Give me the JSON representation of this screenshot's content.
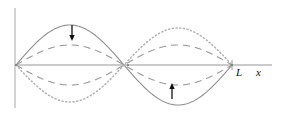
{
  "figure": {
    "background_color": "#ffffff",
    "width": 281,
    "height": 117
  },
  "axes": {
    "x_axis": {
      "name": "horizontal-axis",
      "label": "x",
      "y_position": 65,
      "x_start": 15,
      "x_end": 272,
      "color": "#8a8a8a"
    },
    "y_axis": {
      "name": "vertical-axis",
      "x_position": 15,
      "y_start": 8,
      "y_end": 108,
      "color": "#c9c9c9"
    }
  },
  "markers": [
    {
      "name": "origin-node",
      "label": "",
      "x": 16,
      "y": 65
    },
    {
      "name": "middle-node",
      "label": "",
      "x": 128,
      "y": 65
    },
    {
      "name": "end-node",
      "label": "L",
      "x": 232,
      "y": 65
    }
  ],
  "labels": {
    "length_label": "L",
    "x_axis_label": "x"
  },
  "chart_data": {
    "type": "line",
    "title": "",
    "xlabel": "x",
    "ylabel": "",
    "xlim": [
      0,
      232
    ],
    "ylim": [
      -45,
      45
    ],
    "grid": false,
    "legend": "none",
    "x_tick_labels": [
      "L"
    ],
    "x_tick_values": [
      232
    ],
    "wavelength_mode": 2,
    "string_length_px": 216,
    "baseline_y": 65,
    "series": [
      {
        "name": "solid-curve-max-displacement",
        "style": "solid",
        "color": "#8f8f8f",
        "amplitude_px": 40,
        "phase_sign": 1,
        "description": "maximum positive displacement: crest on left half, trough on right half"
      },
      {
        "name": "dashed-curve-intermediate-positive",
        "style": "dashed",
        "color": "#9a9a9a",
        "amplitude_px": 20,
        "phase_sign": 1,
        "description": "intermediate positive displacement"
      },
      {
        "name": "dashed-curve-intermediate-negative",
        "style": "dashed",
        "color": "#9a9a9a",
        "amplitude_px": 20,
        "phase_sign": -1,
        "description": "intermediate negative displacement"
      },
      {
        "name": "dotted-curve-max-negative",
        "style": "dotted",
        "color": "#b0b0b0",
        "amplitude_px": 37,
        "phase_sign": -1,
        "description": "maximum negative displacement: trough on left half, crest on right half"
      }
    ]
  },
  "annotations": [
    {
      "name": "down-arrow-left-antinode",
      "direction": "down",
      "x": 72,
      "y_start": 25,
      "y_end": 41,
      "color": "#111111",
      "description": "motion of left antinode downward"
    },
    {
      "name": "up-arrow-right-antinode",
      "direction": "up",
      "x": 172,
      "y_start": 99,
      "y_end": 83,
      "color": "#111111",
      "description": "motion of right antinode upward"
    }
  ]
}
